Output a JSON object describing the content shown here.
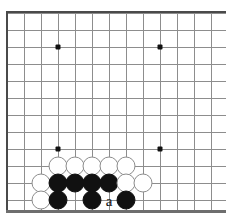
{
  "figure": {
    "kind": "go-board-diagram",
    "width": 226,
    "height": 222,
    "background": "#ffffff"
  },
  "board": {
    "grid_spacing": 17,
    "origin_x": 7,
    "origin_y": 13,
    "cols": 13,
    "rows": 12,
    "line_color": "#8d8d8d",
    "edge_color": "#4a4a4a",
    "bottom_edge_color": "#6e6e6e",
    "edges": {
      "left": true,
      "top": true,
      "bottom": true,
      "right": false
    },
    "bottom_edge_y": 210,
    "star_points": [
      {
        "col": 3,
        "row": 2
      },
      {
        "col": 9,
        "row": 2
      },
      {
        "col": 3,
        "row": 8
      },
      {
        "col": 9,
        "row": 8
      }
    ]
  },
  "stones": [
    {
      "col": 3,
      "row": 9,
      "color": "white"
    },
    {
      "col": 4,
      "row": 9,
      "color": "white"
    },
    {
      "col": 5,
      "row": 9,
      "color": "white"
    },
    {
      "col": 6,
      "row": 9,
      "color": "white"
    },
    {
      "col": 7,
      "row": 9,
      "color": "white"
    },
    {
      "col": 2,
      "row": 10,
      "color": "white"
    },
    {
      "col": 3,
      "row": 10,
      "color": "black"
    },
    {
      "col": 4,
      "row": 10,
      "color": "black"
    },
    {
      "col": 5,
      "row": 10,
      "color": "black"
    },
    {
      "col": 6,
      "row": 10,
      "color": "black"
    },
    {
      "col": 7,
      "row": 10,
      "color": "white"
    },
    {
      "col": 8,
      "row": 10,
      "color": "white"
    },
    {
      "col": 2,
      "row": 11,
      "color": "white"
    },
    {
      "col": 3,
      "row": 11,
      "color": "black"
    },
    {
      "col": 5,
      "row": 11,
      "color": "black"
    },
    {
      "col": 7,
      "row": 11,
      "color": "black"
    }
  ],
  "labels": [
    {
      "text": "a",
      "col": 6,
      "row": 11
    }
  ]
}
